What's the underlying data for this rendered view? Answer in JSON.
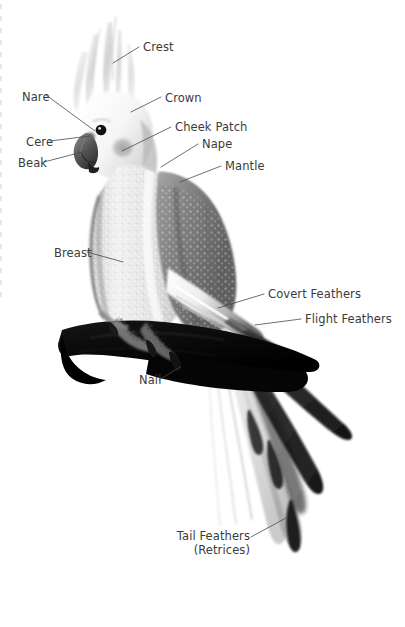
{
  "document": {
    "kind": "anatomy-diagram",
    "subject": "Cockatiel",
    "background_color": "#ffffff",
    "text_color": "#3b3b3b",
    "leader_line_color": "#4a4a4a"
  },
  "labels": [
    {
      "id": "crest",
      "text": "Crest",
      "x": 143,
      "y": 41,
      "align": "left"
    },
    {
      "id": "nare",
      "text": "Nare",
      "x": 22,
      "y": 91,
      "align": "left"
    },
    {
      "id": "crown",
      "text": "Crown",
      "x": 165,
      "y": 92,
      "align": "left"
    },
    {
      "id": "cheek-patch",
      "text": "Cheek Patch",
      "x": 175,
      "y": 121,
      "align": "left"
    },
    {
      "id": "cere",
      "text": "Cere",
      "x": 26,
      "y": 136,
      "align": "left"
    },
    {
      "id": "nape",
      "text": "Nape",
      "x": 202,
      "y": 138,
      "align": "left"
    },
    {
      "id": "beak",
      "text": "Beak",
      "x": 18,
      "y": 157,
      "align": "left"
    },
    {
      "id": "mantle",
      "text": "Mantle",
      "x": 225,
      "y": 160,
      "align": "left"
    },
    {
      "id": "breast",
      "text": "Breast",
      "x": 54,
      "y": 247,
      "align": "left"
    },
    {
      "id": "covert",
      "text": "Covert Feathers",
      "x": 268,
      "y": 288,
      "align": "left"
    },
    {
      "id": "flight",
      "text": "Flight Feathers",
      "x": 305,
      "y": 313,
      "align": "left"
    },
    {
      "id": "nail",
      "text": "Nail",
      "x": 139,
      "y": 374,
      "align": "left"
    }
  ],
  "multiline_labels": [
    {
      "id": "tail-feathers",
      "lines": [
        "Tail Feathers",
        "(Retrices)"
      ],
      "right": 155,
      "y": 530,
      "align": "right"
    }
  ],
  "leader_lines": [
    {
      "id": "crest-leader",
      "points": "139,47 113,63"
    },
    {
      "id": "nare-leader",
      "points": "46,95 95,131"
    },
    {
      "id": "crown-leader",
      "points": "161,97 131,112"
    },
    {
      "id": "cheek-leader",
      "points": "171,127 122,151"
    },
    {
      "id": "cere-leader",
      "points": "50,141 90,136"
    },
    {
      "id": "nape-leader",
      "points": "198,144 161,167"
    },
    {
      "id": "beak-leader",
      "points": "44,162 90,150"
    },
    {
      "id": "mantle-leader",
      "points": "221,166 180,182"
    },
    {
      "id": "breast-leader",
      "points": "87,252 123,262"
    },
    {
      "id": "covert-leader",
      "points": "264,294 218,308"
    },
    {
      "id": "flight-leader",
      "points": "301,319 255,325"
    },
    {
      "id": "nail-leader",
      "points": "159,380 180,367"
    },
    {
      "id": "tail-leader",
      "points": "251,537 286,518"
    }
  ]
}
